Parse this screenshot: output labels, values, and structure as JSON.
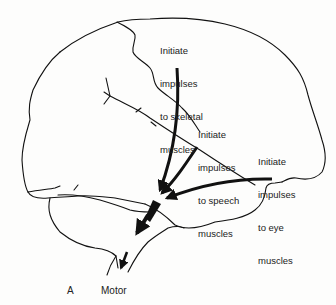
{
  "figure": {
    "title_letter": "A",
    "title": "Motor",
    "colors": {
      "line": "#111111",
      "background": "#fdfdfc",
      "text": "#222222"
    }
  },
  "labels": {
    "skeletal": {
      "lines": [
        "Initiate",
        "impulses",
        "to skeletal",
        "muscles"
      ]
    },
    "speech": {
      "lines": [
        "Initiate",
        "impulses",
        "to speech",
        "muscles"
      ]
    },
    "eye": {
      "lines": [
        "Initiate",
        "impulses",
        "to eye",
        "muscles"
      ]
    }
  },
  "arrows": [
    {
      "name": "skeletal-arrow",
      "from": "skeletal"
    },
    {
      "name": "speech-arrow",
      "from": "speech"
    },
    {
      "name": "eye-arrow",
      "from": "eye"
    },
    {
      "name": "brainstem-arrow",
      "from": "convergence"
    },
    {
      "name": "spinal-arrow",
      "from": "brainstem"
    }
  ]
}
